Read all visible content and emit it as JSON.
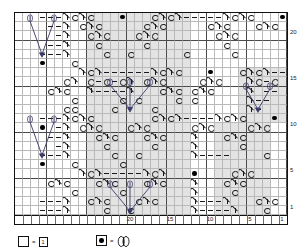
{
  "chart_data": {
    "type": "table",
    "cols": 34,
    "rows": 22,
    "cell_w": 8,
    "cell_h": 9.2,
    "col_labels": [
      {
        "col": 20,
        "text": "20"
      },
      {
        "col": 15,
        "text": "15"
      },
      {
        "col": 10,
        "text": "10"
      },
      {
        "col": 5,
        "text": "5"
      },
      {
        "col": 1,
        "text": "1"
      }
    ],
    "row_labels": [
      {
        "row": 20,
        "text": "20"
      },
      {
        "row": 15,
        "text": "15"
      },
      {
        "row": 10,
        "text": "10"
      },
      {
        "row": 5,
        "text": "5"
      },
      {
        "row": 1,
        "text": "1"
      }
    ],
    "symbols": {
      "blank": "",
      "dash": "purl-stitch-dash",
      "circle": "yarn-over-circle",
      "dot": "bead-filled-dot",
      "dec": "double-decrease-arrow"
    },
    "shaded_bands": [
      {
        "row_from": 12,
        "row_to": 22,
        "col_from": 13,
        "col_to": 25
      },
      {
        "row_from": 1,
        "row_to": 9,
        "col_from": 13,
        "col_to": 25
      },
      {
        "row_from": 1,
        "row_to": 9,
        "col_from": 3,
        "col_to": 9
      }
    ],
    "cells": [
      "...dCdC......CdCd.....dCdC...d.....",
      "B..d...C.C...C.C..C.C..........d...",
      "...d....C.C...C.C...C.C............",
      "...d.....C.....C...................",
      "...d......C...C....................",
      "D..C................................",
      ".....dCd.....dCd....dCd.....d......",
      "..C.d..C.C...C.C..C.C.C......dCd...",
      ".C.C..C.....C...C....C.C...dCd.....",
      "..C....C.....C.......C.......C.....",
      "...dCdC......CdCd.....dCdC...d.....",
      "B..d...C.C...C.C..C.C..........d...",
      "...d....C.C...C.C...C.C............",
      "...d.....C.....C...................",
      "...d......C...C....................",
      "D..C................................",
      ".....dCd.....dCd....dCd.....d......",
      "..C.d..C.C...C.C..C.C.C......dCd...",
      ".C.C..C.....C...C....C.C...dCd.....",
      "..C....C.....C.......C.......C.....",
      "...dCdC......CdCd.....dCdC...d.....",
      "B..d...C.C...C.C..C.C..........d..."
    ],
    "rows_data": [
      {
        "r": 22,
        "glyphs": "---A O A O....#....O A O A -----A O A O....#..."
      },
      {
        "r": 21,
        "glyphs": "H--A .O A O....O A O....O A O....."
      },
      {
        "r": 20,
        "glyphs": "--A ..O A O..O A O...."
      },
      {
        "r": 19,
        "glyphs": "--A ...O....O....."
      },
      {
        "r": 18,
        "glyphs": "--A ...O..O...."
      },
      {
        "r": 17,
        "glyphs": "#..O............."
      }
    ]
  },
  "legend": {
    "items": [
      {
        "swatch": "square",
        "eq": "=",
        "label": "1",
        "label_style": "box",
        "name": "legend-blank-square"
      },
      {
        "swatch": "dot",
        "eq": "=",
        "label": "bead",
        "label_style": "bead",
        "name": "legend-bead-dot"
      }
    ]
  }
}
